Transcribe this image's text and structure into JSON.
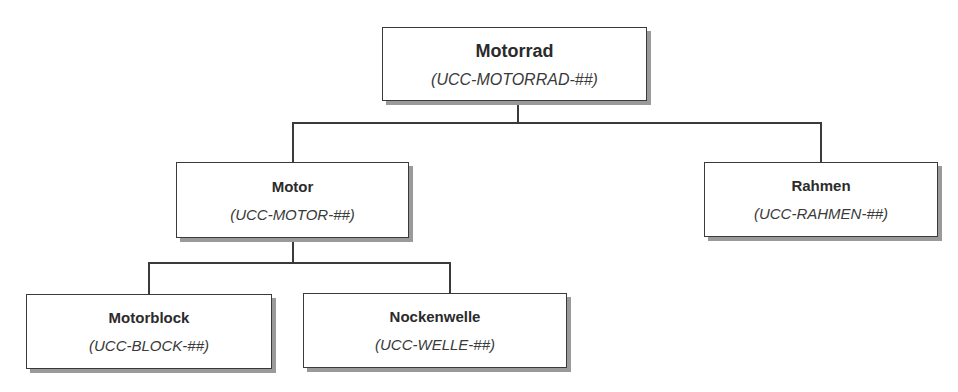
{
  "diagram": {
    "type": "hierarchy",
    "nodes": {
      "root": {
        "title": "Motorrad",
        "code": "(UCC-MOTORRAD-##)"
      },
      "motor": {
        "title": "Motor",
        "code": "(UCC-MOTOR-##)"
      },
      "rahmen": {
        "title": "Rahmen",
        "code": "(UCC-RAHMEN-##)"
      },
      "motorblock": {
        "title": "Motorblock",
        "code": "(UCC-BLOCK-##)"
      },
      "nockenwelle": {
        "title": "Nockenwelle",
        "code": "(UCC-WELLE-##)"
      }
    },
    "edges": [
      [
        "Motorrad",
        "Motor"
      ],
      [
        "Motorrad",
        "Rahmen"
      ],
      [
        "Motor",
        "Motorblock"
      ],
      [
        "Motor",
        "Nockenwelle"
      ]
    ],
    "colors": {
      "border": "#3a3a3a",
      "shadow": "#9a9a9a",
      "background": "#ffffff"
    }
  }
}
